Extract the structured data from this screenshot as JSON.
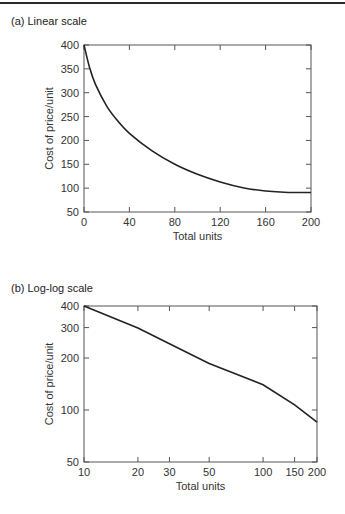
{
  "chart_data": [
    {
      "type": "line",
      "panel_title": "(a) Linear scale",
      "title": "",
      "xlabel": "Total units",
      "ylabel": "Cost of price/unit",
      "x_scale": "linear",
      "y_scale": "linear",
      "xlim": [
        0,
        200
      ],
      "ylim": [
        50,
        400
      ],
      "x_ticks": [
        0,
        40,
        80,
        120,
        160,
        200
      ],
      "y_ticks": [
        50,
        100,
        150,
        200,
        250,
        300,
        350,
        400
      ],
      "grid": false,
      "legend": null,
      "series": [
        {
          "name": "Cost curve",
          "x": [
            0,
            5,
            10,
            20,
            30,
            40,
            60,
            80,
            100,
            120,
            140,
            160,
            180,
            200
          ],
          "y": [
            400,
            352,
            318,
            272,
            240,
            215,
            178,
            150,
            129,
            113,
            101,
            94,
            91,
            91
          ]
        }
      ]
    },
    {
      "type": "line",
      "panel_title": "(b) Log-log scale",
      "title": "",
      "xlabel": "Total units",
      "ylabel": "Cost of price/unit",
      "x_scale": "log",
      "y_scale": "log",
      "xlim": [
        10,
        200
      ],
      "ylim": [
        50,
        400
      ],
      "x_ticks": [
        10,
        20,
        30,
        50,
        100,
        150,
        200
      ],
      "y_ticks": [
        50,
        100,
        200,
        300,
        400
      ],
      "grid": false,
      "legend": null,
      "series": [
        {
          "name": "Cost curve",
          "x": [
            10,
            20,
            30,
            50,
            100,
            150,
            200
          ],
          "y": [
            400,
            298,
            242,
            186,
            140,
            107,
            85
          ]
        }
      ]
    }
  ],
  "panels": {
    "a": {
      "title": "(a) Linear scale"
    },
    "b": {
      "title": "(b) Log-log scale"
    }
  }
}
